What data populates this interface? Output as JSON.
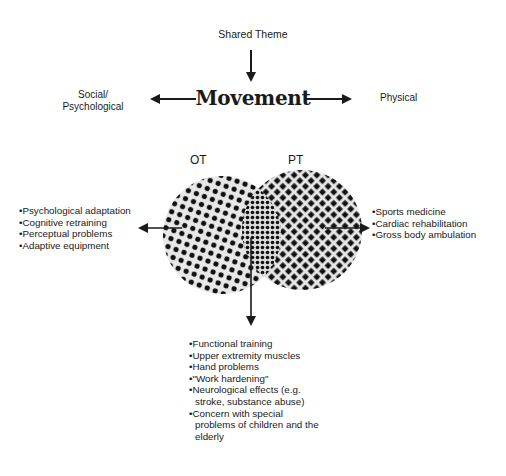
{
  "diagram": {
    "shared_theme_label": "Shared Theme",
    "central_concept": "Movement",
    "left_direction_label": "Social/\nPsychological",
    "left_direction_line1": "Social/",
    "left_direction_line2": "Psychological",
    "right_direction_label": "Physical",
    "circles": [
      {
        "label": "OT",
        "pattern": "dots"
      },
      {
        "label": "PT",
        "pattern": "diamond-crosshatch"
      }
    ],
    "ot_specific": [
      "Psychological adaptation",
      "Cognitive retraining",
      "Perceptual problems",
      "Adaptive equipment"
    ],
    "pt_specific": [
      "Sports medicine",
      "Cardiac rehabilitation",
      "Gross body ambulation"
    ],
    "shared_overlap": [
      "Functional training",
      "Upper extremity muscles",
      "Hand problems",
      "\"Work hardening\"",
      "Neurological effects (e.g. stroke, substance abuse)",
      "Concern with special problems of children and the elderly"
    ],
    "colors": {
      "ink": "#1a1a1a",
      "background": "#ffffff",
      "shade": "#e6e6e6"
    }
  }
}
